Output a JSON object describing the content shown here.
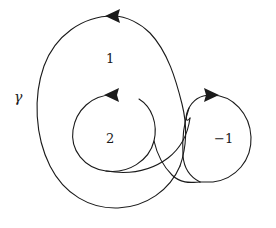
{
  "figure": {
    "kind": "winding-number-diagram",
    "width": 276,
    "height": 228,
    "background_color": "#ffffff",
    "stroke_color": "#1a1a1a",
    "stroke_width": 1.1
  },
  "curve": {
    "name_label": "γ",
    "name_label_x": 14,
    "name_label_y": 90,
    "description_not_rendered": ""
  },
  "regions": [
    {
      "id": "outer-annulus",
      "label": "1",
      "x": 106,
      "y": 52,
      "winding_number": 1
    },
    {
      "id": "inner-loop",
      "label": "2",
      "x": 106,
      "y": 132,
      "winding_number": 2
    },
    {
      "id": "right-loop",
      "label": "−1",
      "x": 214,
      "y": 132,
      "winding_number": -1
    }
  ],
  "arrows": [
    {
      "id": "outer-top-arrow",
      "direction": "left",
      "orientation": "counterclockwise",
      "x": 113,
      "y": 17
    },
    {
      "id": "inner-top-arrow",
      "direction": "left",
      "orientation": "counterclockwise",
      "x": 113,
      "y": 96
    },
    {
      "id": "right-loop-arrow",
      "direction": "right",
      "orientation": "clockwise",
      "x": 211,
      "y": 96
    }
  ],
  "paths": {
    "outer_big_loop": "M 113 15 C 72 15 39 55 38 112 C 37 170 78 208 124 208 C 158 208 182 186 186 160",
    "outer_to_inner_transition": "M 186 160 C 190 132 184 104 172 84 C 158 60 142 35 113 15",
    "inner_loop": "M 113 94 C 88 94 72 113 72 134 C 72 158 90 172 113 172 C 140 172 156 152 156 130 C 156 112 146 98 132 94",
    "right_loop": "M 211 94 C 234 94 252 113 252 136 C 252 163 230 182 206 182 C 186 182 172 168 170 150"
  }
}
